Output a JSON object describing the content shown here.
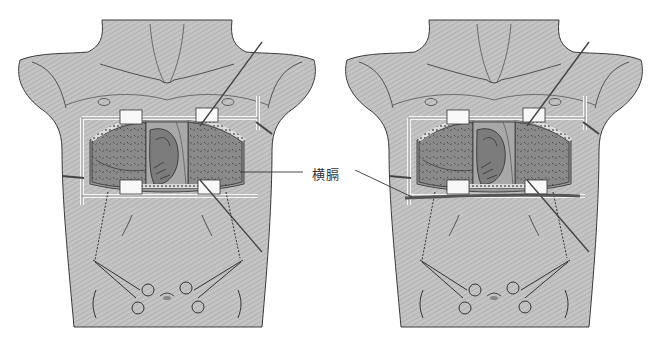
{
  "figure": {
    "type": "surgical-illustration",
    "panels": [
      {
        "id": "left",
        "offset_x": 0,
        "description": "Open chest with retractor frame, heart visible, sutures to hemostats"
      },
      {
        "id": "right",
        "offset_x": 327,
        "description": "Same view with diaphragm band pulled taut beneath retractor"
      }
    ],
    "annotation": {
      "text": "横膈",
      "x": 312,
      "y": 164,
      "leader_left": {
        "x1": 240,
        "y1": 172,
        "x2": 303,
        "y2": 172
      },
      "leader_right": {
        "x1": 355,
        "y1": 170,
        "x2": 412,
        "y2": 197
      }
    },
    "colors": {
      "skin": "#b8b8b8",
      "skin_light": "#cfcfcf",
      "outline": "#3a3a3a",
      "lung": "#7a7a7a",
      "heart": "#8c8c8c",
      "retractor": "#f4f4f4",
      "diaphragm_band": "#555555"
    }
  }
}
